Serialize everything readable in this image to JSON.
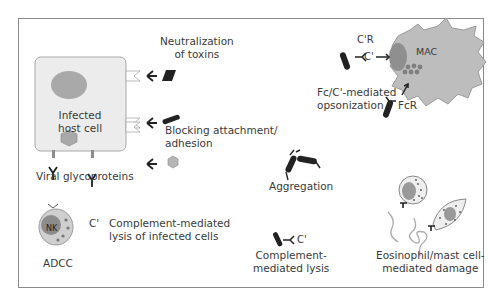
{
  "diagram": {
    "type": "antibody-effector-functions",
    "host_cell": {
      "label_line1": "Infected",
      "label_line2": "host cell",
      "glycoprotein_label": "Viral glycoproteins",
      "fill": "#e8e8e8",
      "nucleus_fill": "#a9a9a9"
    },
    "mechanisms": [
      {
        "id": "neutralization",
        "line1": "Neutralization",
        "line2": "of toxins"
      },
      {
        "id": "blocking",
        "line1": "Blocking attachment/",
        "line2": "adhesion"
      },
      {
        "id": "adcc",
        "line1": "ADCC",
        "cell_label": "NK"
      },
      {
        "id": "complement-infected",
        "line1": "Complement-mediated",
        "line2": "lysis of infected cells",
        "marker": "C'"
      },
      {
        "id": "opsonization",
        "line1": "Fc/C'-mediated",
        "line2": "opsonization",
        "receptor1": "C'R",
        "receptor2": "FcR",
        "complement": "C'",
        "cell_label": "MAC"
      },
      {
        "id": "aggregation",
        "line1": "Aggregation"
      },
      {
        "id": "complement-lysis",
        "line1": "Complement-",
        "line2": "mediated lysis",
        "marker": "C'"
      },
      {
        "id": "eosinophil",
        "line1": "Eosinophil/mast cell-",
        "line2": "mediated damage"
      }
    ],
    "colors": {
      "frame": "#8a8a8a",
      "cell_gray": "#b5b5b5",
      "dark_gray": "#8c8c8c",
      "antibody": "#222222",
      "text": "#3a3a3a"
    }
  }
}
